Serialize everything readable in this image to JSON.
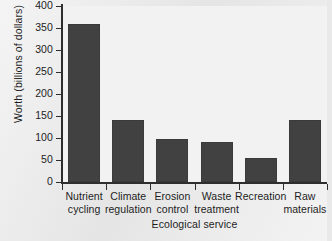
{
  "chart_data": {
    "type": "bar",
    "title": "",
    "xlabel": "Ecological service",
    "ylabel": "Worth (billions of dollars)",
    "categories": [
      "Nutrient cycling",
      "Climate regulation",
      "Erosion control",
      "Waste treatment",
      "Recreation",
      "Raw materials"
    ],
    "category_lines": [
      [
        "Nutrient",
        "cycling"
      ],
      [
        "Climate",
        "regulation"
      ],
      [
        "Erosion",
        "control"
      ],
      [
        "Waste",
        "treatment"
      ],
      [
        "Recreation",
        ""
      ],
      [
        "Raw",
        "materials"
      ]
    ],
    "values": [
      358,
      142,
      98,
      90,
      55,
      141
    ],
    "ylim": [
      0,
      400
    ],
    "yticks": [
      0,
      50,
      100,
      150,
      200,
      250,
      300,
      350,
      400
    ],
    "ytick_labels": [
      "0",
      "50",
      "100",
      "150",
      "200",
      "250",
      "300",
      "350",
      "400"
    ],
    "grid": false,
    "legend": null,
    "bar_color": "#414141",
    "plot_background": "#f2f2f2",
    "axis_color": "#2e2e2e",
    "text_color": "#1d1d1d"
  }
}
